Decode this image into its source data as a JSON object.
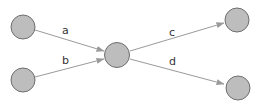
{
  "diagram": {
    "type": "directed-graph",
    "colors": {
      "node_fill": "#bdbdbd",
      "node_stroke": "#6e6e6e",
      "edge": "#9a9a9a",
      "label": "#333333",
      "background": "#ffffff"
    },
    "nodes": [
      {
        "id": "n_top_left",
        "cx": 23,
        "cy": 27,
        "r": 12
      },
      {
        "id": "n_bottom_left",
        "cx": 23,
        "cy": 80,
        "r": 12
      },
      {
        "id": "n_center",
        "cx": 117,
        "cy": 55,
        "r": 12.5
      },
      {
        "id": "n_top_right",
        "cx": 237,
        "cy": 20,
        "r": 12
      },
      {
        "id": "n_bottom_right",
        "cx": 238,
        "cy": 88,
        "r": 12
      }
    ],
    "edges": [
      {
        "id": "a",
        "label": "a",
        "from": "n_top_left",
        "to": "n_center",
        "x1": 35,
        "y1": 30,
        "x2": 104,
        "y2": 51,
        "lx": 62,
        "ly": 34
      },
      {
        "id": "b",
        "label": "b",
        "from": "n_bottom_left",
        "to": "n_center",
        "x1": 35,
        "y1": 77,
        "x2": 104,
        "y2": 59,
        "lx": 62,
        "ly": 64
      },
      {
        "id": "c",
        "label": "c",
        "from": "n_center",
        "to": "n_top_right",
        "x1": 130,
        "y1": 51,
        "x2": 224,
        "y2": 23,
        "lx": 169,
        "ly": 36
      },
      {
        "id": "d",
        "label": "d",
        "from": "n_center",
        "to": "n_bottom_right",
        "x1": 130,
        "y1": 59,
        "x2": 224,
        "y2": 84,
        "lx": 169,
        "ly": 65
      }
    ]
  }
}
